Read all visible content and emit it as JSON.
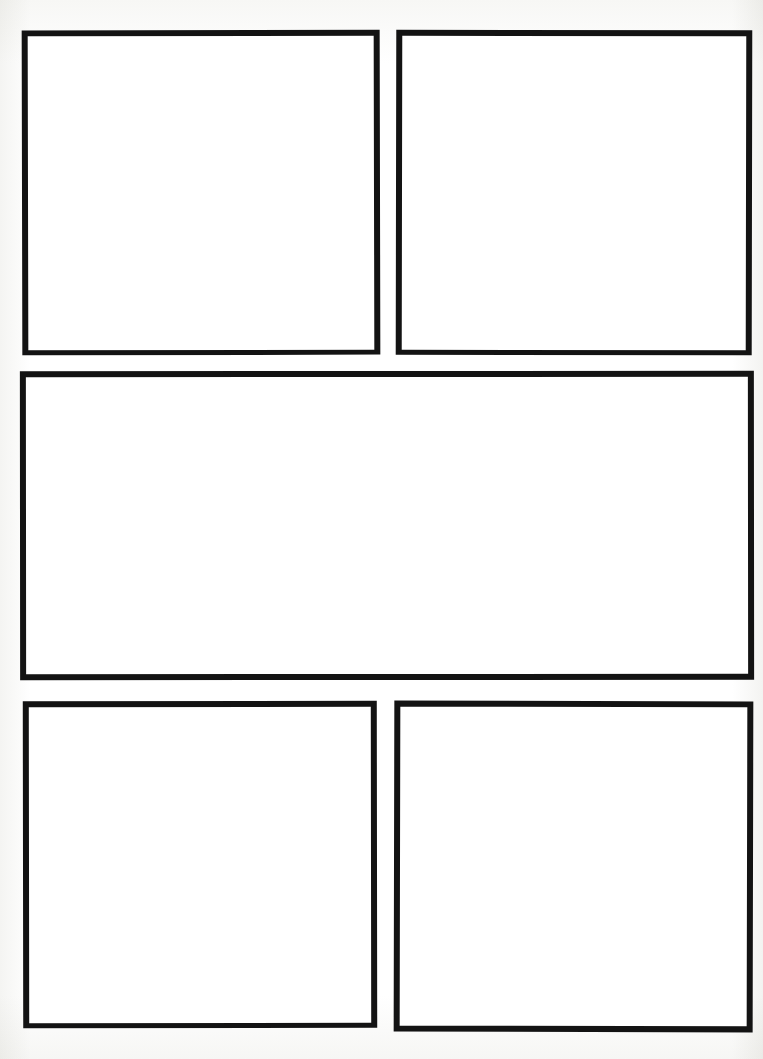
{
  "page": {
    "background_color": "#fdfdfc",
    "border_color": "#131313",
    "panel_fill_color": "#ffffff",
    "width": 763,
    "height": 1059,
    "panel_count": 5,
    "layout_description": "2 panels top row, 1 wide panel middle row, 2 panels bottom row",
    "visible_text": ""
  },
  "panels": [
    {
      "id": "panel-1",
      "row": 1,
      "position": "top-left",
      "label": "",
      "content": "",
      "x": 22,
      "y": 30,
      "width": 358,
      "height": 325,
      "border_width": 6
    },
    {
      "id": "panel-2",
      "row": 1,
      "position": "top-right",
      "label": "",
      "content": "",
      "x": 396,
      "y": 30,
      "width": 356,
      "height": 325,
      "border_width": 6
    },
    {
      "id": "panel-3",
      "row": 2,
      "position": "middle-wide",
      "label": "",
      "content": "",
      "x": 20,
      "y": 371,
      "width": 734,
      "height": 309,
      "border_width": 6
    },
    {
      "id": "panel-4",
      "row": 3,
      "position": "bottom-left",
      "label": "",
      "content": "",
      "x": 23,
      "y": 701,
      "width": 354,
      "height": 327,
      "border_width": 6
    },
    {
      "id": "panel-5",
      "row": 3,
      "position": "bottom-right",
      "label": "",
      "content": "",
      "x": 394,
      "y": 701,
      "width": 359,
      "height": 331,
      "border_width": 6
    }
  ]
}
